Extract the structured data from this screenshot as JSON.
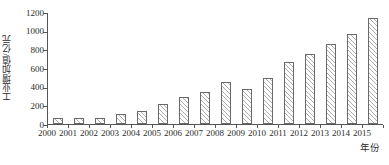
{
  "chart_data": {
    "type": "bar",
    "title": "",
    "subtitle": "",
    "xlabel": "年份",
    "ylabel": "工业增加值/亿元",
    "categories": [
      "2000",
      "2001",
      "2002",
      "2003",
      "2004",
      "2005",
      "2006",
      "2007",
      "2008",
      "2009",
      "2010",
      "2011",
      "2012",
      "2013",
      "2014",
      "2015"
    ],
    "values": [
      60,
      65,
      65,
      105,
      135,
      215,
      290,
      340,
      450,
      375,
      490,
      660,
      755,
      855,
      960,
      1135
    ],
    "series": [
      {
        "name": "工业增加值",
        "values": [
          60,
          65,
          65,
          105,
          135,
          215,
          290,
          340,
          450,
          375,
          490,
          660,
          755,
          855,
          960,
          1135
        ]
      }
    ],
    "ylim": [
      0,
      1200
    ],
    "yticks": [
      0,
      200,
      400,
      600,
      800,
      1000,
      1200
    ],
    "ytick_labels": [
      "0",
      "200",
      "400",
      "600",
      "800",
      "1000",
      "1200"
    ],
    "xtick_labels": [
      "2000",
      "2001",
      "2002",
      "2003",
      "2004",
      "2005",
      "2006",
      "2007",
      "2008",
      "2009",
      "2010",
      "2011",
      "2012",
      "2013",
      "2014",
      "2015"
    ],
    "grid": false,
    "legend": null,
    "legend_position": "none",
    "bar_fill": "diagonal-hatch",
    "bar_edge_color": "#6a6a6a",
    "axis_color": "#555555",
    "text_color": "#2b2b2b",
    "background_color": "#ffffff"
  }
}
